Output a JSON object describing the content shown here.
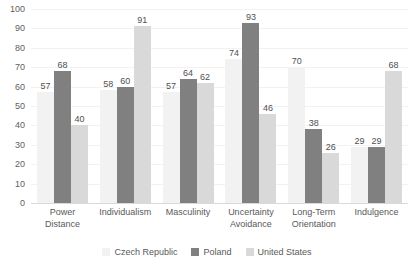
{
  "chart_data": {
    "type": "bar",
    "title": "",
    "subtitle": "",
    "xlabel": "",
    "ylabel": "",
    "ylim": [
      0,
      100
    ],
    "y_ticks": [
      100,
      90,
      80,
      70,
      60,
      50,
      40,
      30,
      20,
      10,
      0
    ],
    "grid": "horizontal",
    "legend_position": "bottom",
    "categories": [
      "Power Distance",
      "Individualism",
      "Masculinity",
      "Uncertainty Avoidance",
      "Long-Term Orientation",
      "Indulgence"
    ],
    "category_lines": [
      [
        "Power",
        "Distance"
      ],
      [
        "Individualism",
        ""
      ],
      [
        "Masculinity",
        ""
      ],
      [
        "Uncertainty",
        "Avoidance"
      ],
      [
        "Long-Term",
        "Orientation"
      ],
      [
        "Indulgence",
        ""
      ]
    ],
    "series": [
      {
        "name": "Czech Republic",
        "color": "#F2F2F2",
        "values": [
          57,
          58,
          57,
          74,
          70,
          29
        ]
      },
      {
        "name": "Poland",
        "color": "#808080",
        "values": [
          68,
          60,
          64,
          93,
          38,
          29
        ]
      },
      {
        "name": "United States",
        "color": "#D9D9D9",
        "values": [
          40,
          91,
          62,
          46,
          26,
          68
        ]
      }
    ]
  }
}
